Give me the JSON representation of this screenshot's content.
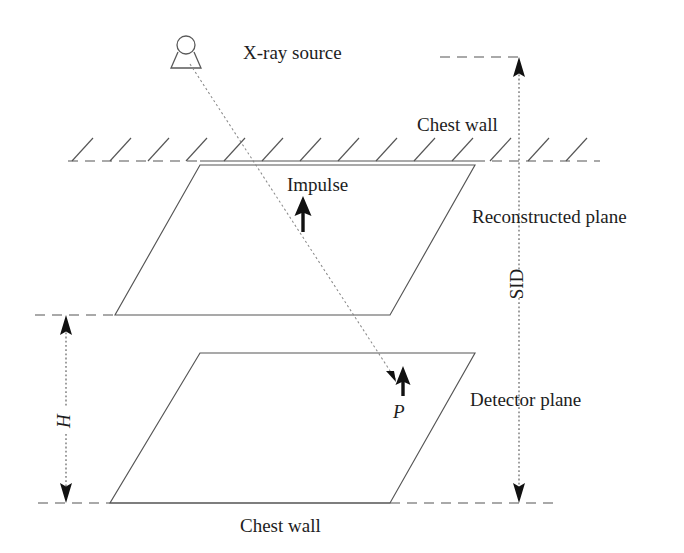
{
  "figure": {
    "background_color": "#ffffff",
    "line_color": "#555555",
    "ray_color": "#8a8a8a",
    "arrow_color": "#111111",
    "width": 684,
    "height": 553
  },
  "labels": {
    "xray_source": "X-ray source",
    "chest_wall_top": "Chest wall",
    "chest_wall_bottom": "Chest wall",
    "impulse": "Impulse",
    "reconstructed_plane": "Reconstructed plane",
    "detector_plane": "Detector plane",
    "sid": "SID",
    "height": "H",
    "point_p": "P"
  },
  "icons": {
    "xray_source": "xray-tube-icon",
    "impulse_arrow": "up-arrow-icon",
    "point_arrow": "up-arrow-icon",
    "sid_arrow_top": "arrow-up-icon",
    "sid_arrow_bottom": "arrow-down-icon",
    "height_arrow_top": "arrow-up-icon",
    "height_arrow_bottom": "arrow-down-icon"
  },
  "geometry": {
    "source_point": {
      "x": 186,
      "y": 55
    },
    "ray_end_point": {
      "x": 398,
      "y": 382
    },
    "reconstructed_plane_vertices": "200,165 475,165 390,315 115,315",
    "detector_plane_vertices": "200,353 475,353 390,503 110,503",
    "chest_wall_top_y": 161,
    "chest_wall_bottom_y": 503,
    "sid_line_x": 519,
    "sid_top_y": 57,
    "sid_bottom_y": 503,
    "height_line_x": 66,
    "height_top_y": 315,
    "height_bottom_y": 503
  },
  "annotations": [
    {
      "name": "xray-source-label",
      "text": "X-ray source",
      "x": 243,
      "y": 55
    },
    {
      "name": "chest-wall-top-label",
      "text": "Chest wall",
      "x": 417,
      "y": 127
    },
    {
      "name": "impulse-label",
      "text": "Impulse",
      "x": 287,
      "y": 187
    },
    {
      "name": "reconstructed-plane-label",
      "text": "Reconstructed plane",
      "x": 472,
      "y": 219
    },
    {
      "name": "sid-label",
      "text": "SID",
      "x": 512,
      "y": 284
    },
    {
      "name": "point-p-label",
      "text": "P",
      "x": 397,
      "y": 413
    },
    {
      "name": "detector-plane-label",
      "text": "Detector plane",
      "x": 470,
      "y": 402
    },
    {
      "name": "height-label",
      "text": "H",
      "x": 52,
      "y": 420
    },
    {
      "name": "chest-wall-bottom-label",
      "text": "Chest wall",
      "x": 240,
      "y": 528
    }
  ]
}
